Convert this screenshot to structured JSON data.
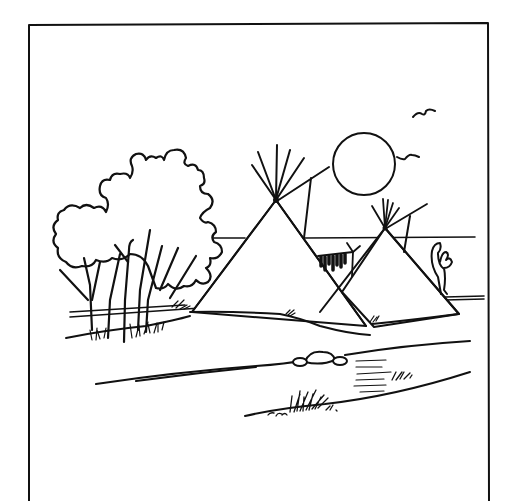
{
  "illustration": {
    "title": "Tipi camp by a stream",
    "style": "black ink line drawing",
    "colors": {
      "ink": "#111111",
      "paper": "#ffffff"
    },
    "elements": [
      "frame-border",
      "sun",
      "bird",
      "bird",
      "tree-with-hatched-foliage",
      "large-tipi",
      "small-tipi",
      "drying-rack",
      "hills-horizon",
      "stream",
      "rock",
      "grass-tufts"
    ]
  }
}
